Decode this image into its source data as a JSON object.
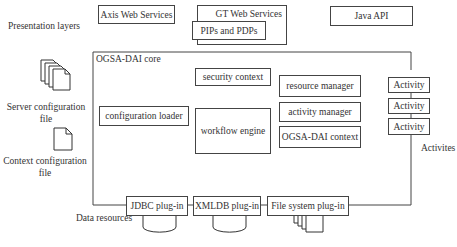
{
  "labels": {
    "presentation_layers": "Presentation layers",
    "server_config_line1": "Server configuration",
    "server_config_line2": "file",
    "context_config_line1": "Context configuration",
    "context_config_line2": "file",
    "data_resources": "Data resources",
    "activites": "Activites"
  },
  "presentation": {
    "axis": "Axis Web Services",
    "gt": "GT Web Services",
    "pips": "PIPs and PDPs",
    "java": "Java API"
  },
  "core": {
    "title": "OGSA-DAI core",
    "security_context": "security context",
    "configuration_loader": "configuration loader",
    "workflow_engine": "workflow engine",
    "resource_manager": "resource manager",
    "activity_manager": "activity manager",
    "ogsa_dai_context": "OGSA-DAI context"
  },
  "activities": [
    "Activity",
    "Activity",
    "Activity"
  ],
  "plugins": {
    "jdbc": "JDBC plug-in",
    "xmldb": "XMLDB plug-in",
    "filesystem": "File system plug-in"
  }
}
